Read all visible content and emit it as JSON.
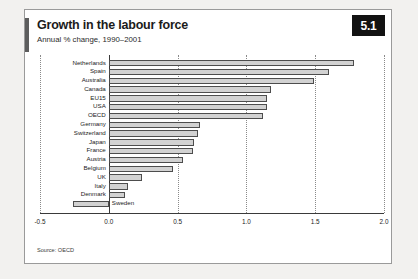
{
  "figure": {
    "number_badge": "5.1",
    "title": "Growth in the labour force",
    "subtitle": "Annual % change, 1990–2001",
    "source": "Source: OECD"
  },
  "chart_data": {
    "type": "bar",
    "orientation": "horizontal",
    "title": "Growth in the labour force",
    "subtitle": "Annual % change, 1990–2001",
    "xlabel": "",
    "ylabel": "",
    "xlim": [
      -0.5,
      2.0
    ],
    "xticks": [
      "-0.5",
      "0.0",
      "0.5",
      "1.0",
      "1.5",
      "2.0"
    ],
    "xtick_values": [
      -0.5,
      0.0,
      0.5,
      1.0,
      1.5,
      2.0
    ],
    "grid": true,
    "legend": "none",
    "source": "Source: OECD",
    "categories": [
      "Netherlands",
      "Spain",
      "Australia",
      "Canada",
      "EU15",
      "USA",
      "OECD",
      "Germany",
      "Switzerland",
      "Japan",
      "France",
      "Austria",
      "Belgium",
      "UK",
      "Italy",
      "Denmark",
      "Sweden"
    ],
    "values": [
      1.78,
      1.6,
      1.49,
      1.18,
      1.15,
      1.15,
      1.12,
      0.66,
      0.65,
      0.62,
      0.61,
      0.54,
      0.47,
      0.24,
      0.14,
      0.12,
      -0.26
    ],
    "bar_fill_color": "#d2d2d2",
    "bar_edge_color": "#4d4d4d"
  },
  "colors": {
    "badge_background": "#121212",
    "badge_text": "#ffffff",
    "accent": "#5d5d5d",
    "page_background": "#f2f1ef",
    "figure_background": "#ffffff"
  }
}
